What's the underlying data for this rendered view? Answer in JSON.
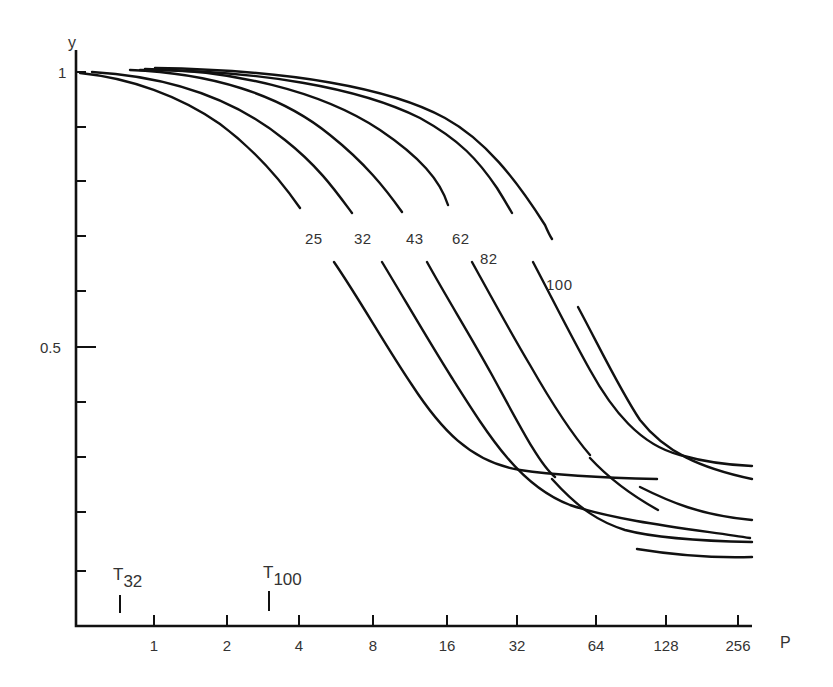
{
  "chart_data": {
    "type": "line",
    "title": "",
    "xlabel": "P",
    "ylabel": "y",
    "x_scale": "log2",
    "x_ticks": [
      "1",
      "2",
      "4",
      "8",
      "16",
      "32",
      "64",
      "128",
      "256"
    ],
    "y_ticks_labeled": [
      "1",
      "0.5"
    ],
    "y_minor_ticks": [
      0.1,
      0.2,
      0.3,
      0.4,
      0.6,
      0.7,
      0.8,
      0.9
    ],
    "ylim": [
      0,
      1.05
    ],
    "xlim": [
      0.48,
      300
    ],
    "grid": false,
    "legend": "inline curve labels",
    "annotations": [
      {
        "label": "T",
        "subscript": "32",
        "x_approx": 0.65
      },
      {
        "label": "T",
        "subscript": "100",
        "x_approx": 3.2
      }
    ],
    "series": [
      {
        "name": "25",
        "x": [
          0.5,
          1,
          2,
          4,
          8,
          11,
          16,
          32,
          64,
          128
        ],
        "y": [
          1.0,
          0.98,
          0.91,
          0.79,
          0.6,
          0.5,
          0.39,
          0.28,
          0.265,
          0.26
        ]
      },
      {
        "name": "32",
        "x": [
          0.6,
          1,
          2,
          4,
          8,
          16,
          32,
          64,
          128,
          256
        ],
        "y": [
          1.0,
          0.99,
          0.95,
          0.86,
          0.71,
          0.5,
          0.32,
          0.21,
          0.17,
          0.16
        ]
      },
      {
        "name": "43",
        "x": [
          0.8,
          1,
          2,
          4,
          8,
          16,
          24,
          32,
          64,
          128,
          256
        ],
        "y": [
          1.0,
          1.0,
          0.97,
          0.91,
          0.8,
          0.62,
          0.5,
          0.42,
          0.24,
          0.18,
          0.15
        ]
      },
      {
        "name": "62",
        "x": [
          1,
          2,
          4,
          8,
          16,
          36,
          64,
          128,
          256
        ],
        "y": [
          1.0,
          0.99,
          0.95,
          0.87,
          0.72,
          0.5,
          0.33,
          0.23,
          0.2
        ]
      },
      {
        "name": "82",
        "x": [
          1,
          2,
          4,
          8,
          16,
          32,
          53,
          128,
          256
        ],
        "y": [
          1.0,
          1.0,
          0.97,
          0.92,
          0.82,
          0.64,
          0.5,
          0.29,
          0.24
        ]
      },
      {
        "name": "100",
        "x": [
          1,
          2,
          4,
          8,
          16,
          32,
          68,
          128,
          256
        ],
        "y": [
          1.0,
          1.0,
          0.98,
          0.94,
          0.86,
          0.7,
          0.5,
          0.33,
          0.26
        ]
      }
    ]
  },
  "render": {
    "axis": {
      "origin": [
        76,
        626
      ],
      "y_top": [
        76,
        50
      ],
      "x_end": [
        752,
        626
      ]
    },
    "y_ticks_px": [
      72,
      127,
      181,
      236,
      291,
      347,
      402,
      457,
      512,
      571
    ],
    "y_labels": [
      {
        "text": "y",
        "x": 68,
        "y": 48,
        "cls": "axis-title"
      },
      {
        "text": "1",
        "x": 58,
        "y": 78,
        "cls": "tick-label"
      },
      {
        "text": "0.5",
        "x": 40,
        "y": 353,
        "cls": "tick-label"
      }
    ],
    "x_ticks_px": [
      {
        "x": 154,
        "label": "1"
      },
      {
        "x": 227,
        "label": "2"
      },
      {
        "x": 299,
        "label": "4"
      },
      {
        "x": 373,
        "label": "8"
      },
      {
        "x": 447,
        "label": "16"
      },
      {
        "x": 517,
        "label": "32"
      },
      {
        "x": 596,
        "label": "64"
      },
      {
        "x": 666,
        "label": "128"
      },
      {
        "x": 738,
        "label": "256"
      }
    ],
    "x_axis_title": {
      "text": "P",
      "x": 780,
      "y": 648
    },
    "markers": [
      {
        "x": 120,
        "y1": 595,
        "y2": 613,
        "label": "T",
        "sub": "32",
        "lx": 113,
        "ly": 580
      },
      {
        "x": 269,
        "y1": 591,
        "y2": 611,
        "label": "T",
        "sub": "100",
        "lx": 263,
        "ly": 578
      }
    ],
    "curves": [
      {
        "name": "25",
        "segments": [
          "M80,73 C130,78 180,96 220,124 C255,150 282,182 300,208",
          "M334,262 C360,300 385,345 412,385 C440,428 470,462 520,470 C560,476 610,478 657,479"
        ],
        "label": {
          "text": "25",
          "x": 305,
          "y": 244
        }
      },
      {
        "name": "32",
        "segments": [
          "M92,72 C160,76 230,95 285,140 C318,166 335,190 352,213",
          "M382,262 C405,300 428,340 452,378 C490,438 520,486 570,505 C620,522 700,530 750,538"
        ],
        "label": {
          "text": "32",
          "x": 354,
          "y": 244
        }
      },
      {
        "name": "43",
        "segments": [
          "M130,70 C210,73 280,94 330,135 C365,163 385,188 402,212",
          "M427,262 C448,300 470,335 492,375 C522,430 540,465 555,477",
          "M552,479 C580,510 600,522 625,530 C655,538 700,541 752,542"
        ],
        "label": {
          "text": "43",
          "x": 406,
          "y": 244
        }
      },
      {
        "name": "62",
        "segments": [
          "M145,69 C230,70 320,90 380,130 C420,157 440,180 448,205",
          "M472,262 C493,300 512,335 530,365 C550,400 570,432 590,455",
          "M590,458 C615,485 640,500 658,510"
        ],
        "label": {
          "text": "62",
          "x": 452,
          "y": 244
        }
      },
      {
        "name": "62b",
        "segments": [
          "M637,549 C680,556 720,558 752,557"
        ],
        "label": null
      },
      {
        "name": "82",
        "segments": [
          "M140,70 C260,70 360,88 420,118 C460,140 478,160 497,188 C502,196 508,206 512,213",
          "M533,262 C553,300 572,338 590,370 C612,410 640,445 680,455 C705,462 725,465 752,466",
          "M640,487 C670,502 700,515 752,520"
        ],
        "label": {
          "text": "82",
          "x": 480,
          "y": 264
        }
      },
      {
        "name": "100",
        "segments": [
          "M155,68 C290,70 390,88 445,118 C485,140 515,178 545,225 C548,232 550,236 552,239",
          "M578,307 C600,348 620,390 640,420 C665,452 700,468 752,479"
        ],
        "label": {
          "text": "100",
          "x": 546,
          "y": 290
        }
      }
    ]
  }
}
